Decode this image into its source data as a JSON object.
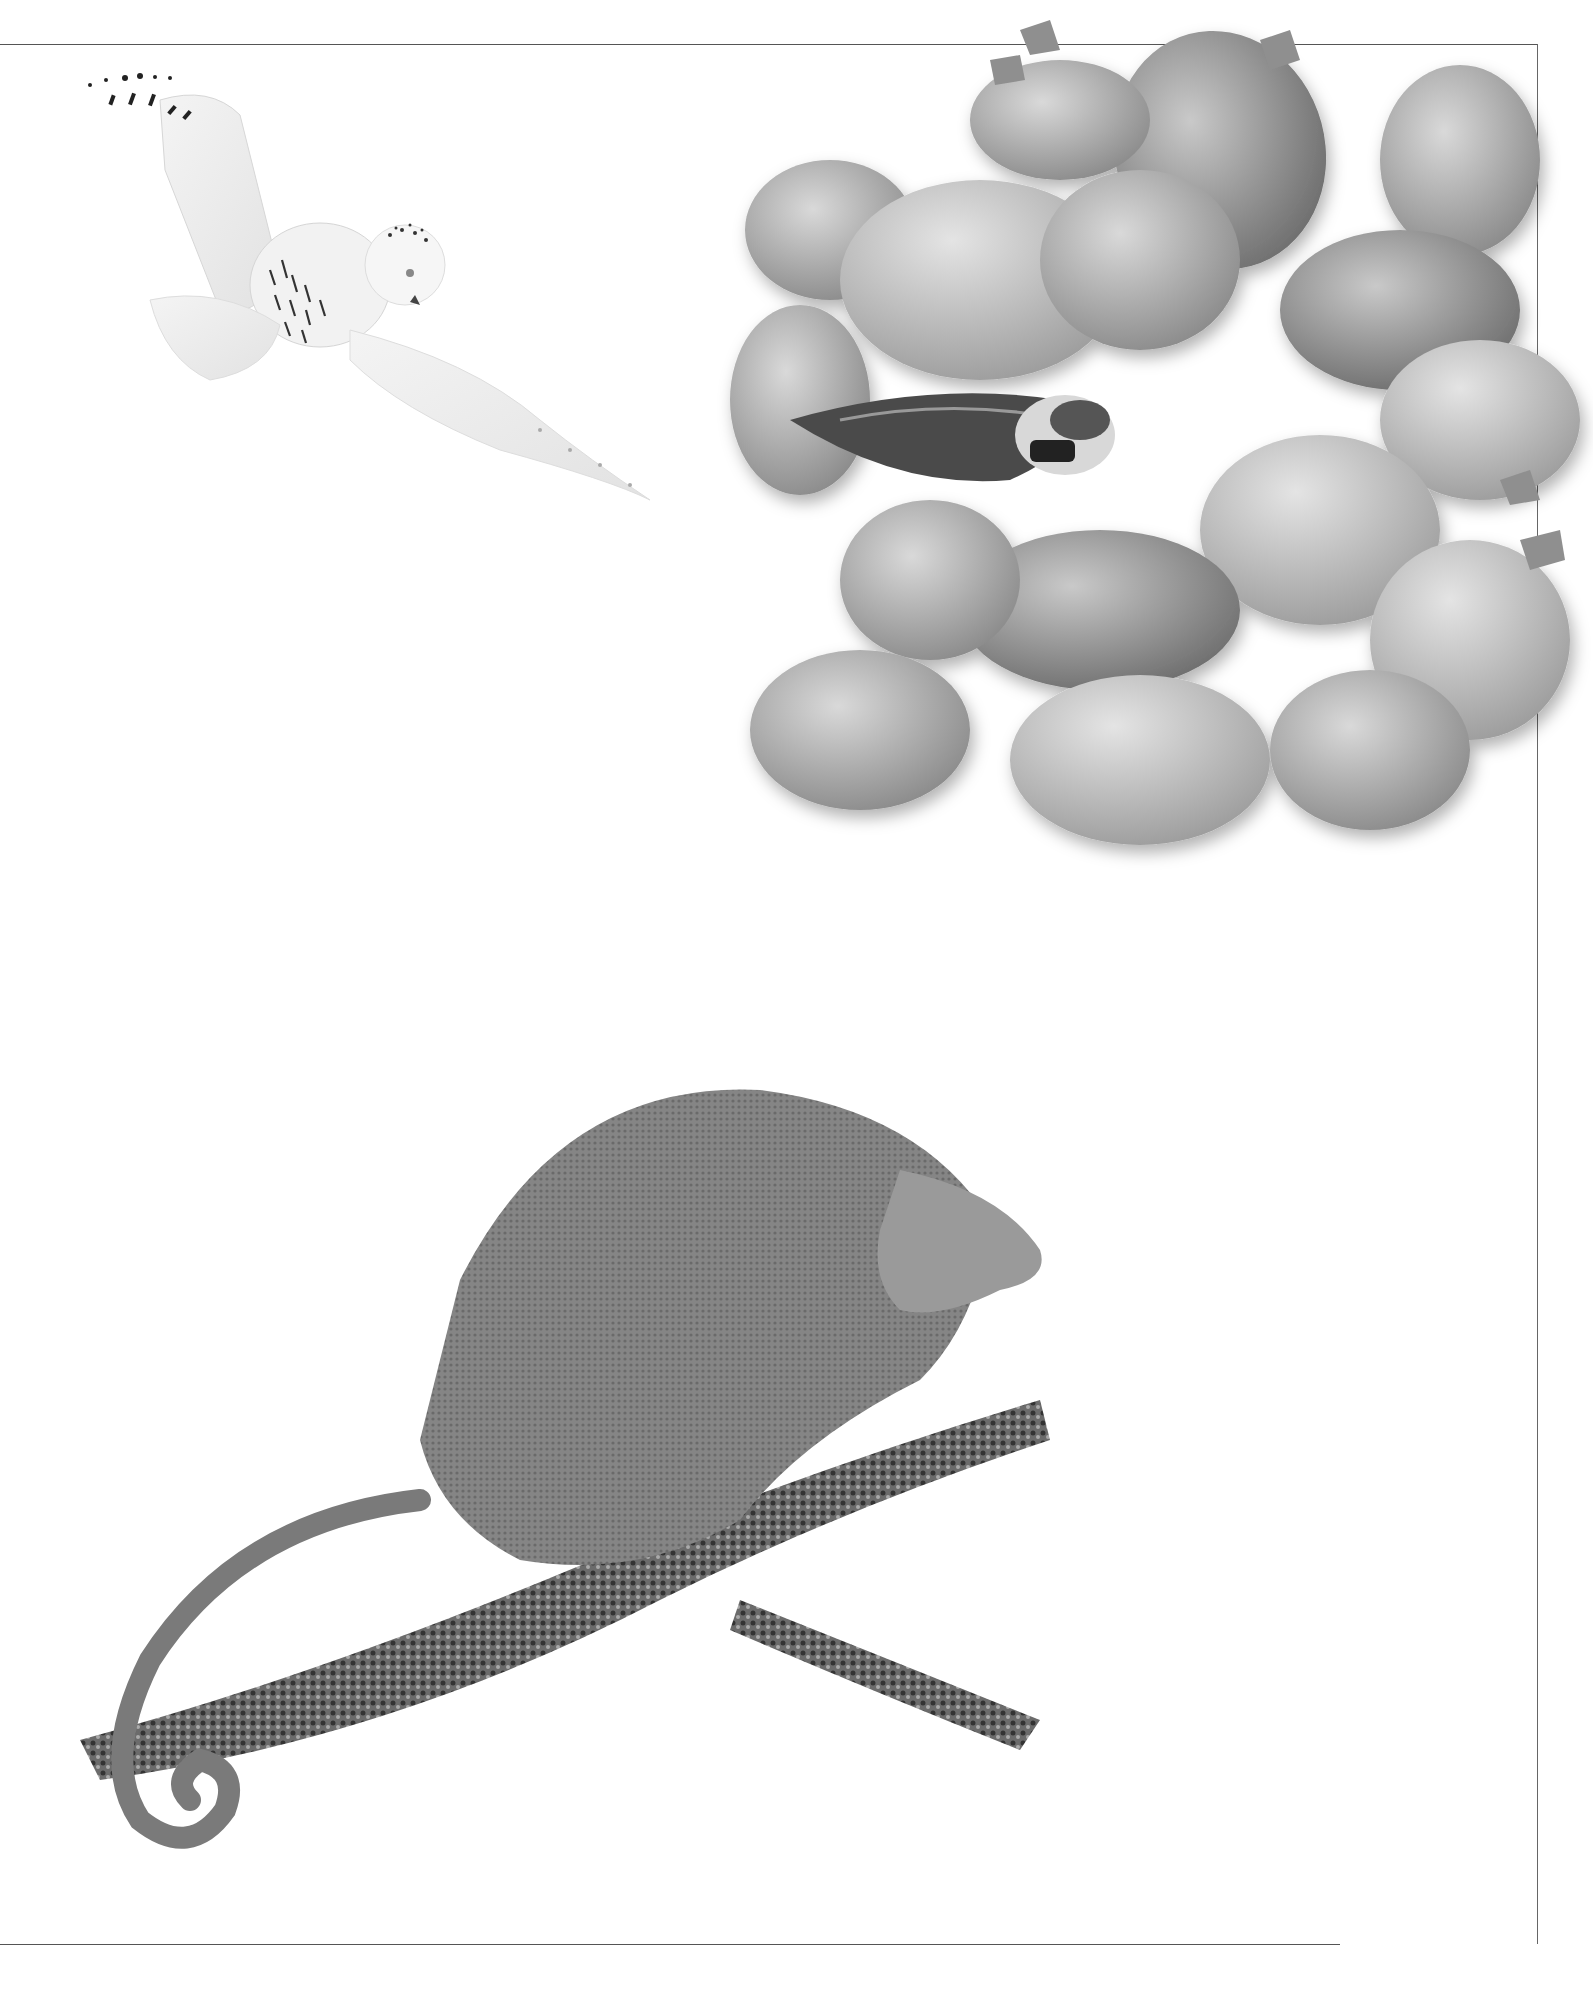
{
  "header": {
    "running_head": "CAMOUFLAGE"
  },
  "footer": {
    "page_number": "37"
  },
  "sections": {
    "arctic_owl": {
      "heading": "Arctic owl",
      "lines": [
        "The snowy owl has a coat of",
        "white feathers that allow it to",
        "blend in with the white landscape",
        "of the snow-covered Arctic",
        "tundra. Many owls living in other",
        "parts of the world hunt at night",
        "where they rely on the dark to",
        "hide them from danger. Summer",
        "days in the Arctic are very long,",
        "so the snowy owl has to fly in",
        "daylight to find food for its young.",
        "Without the camouflage of its",
        "feathers, the owl would be easily",
        "spotted by its prey."
      ]
    },
    "mimicking_stones": {
      "heading": "Mimicking stones",
      "lines": [
        "A pebble or gravel beach may seem an unlikely hiding place for",
        "a bird. Once it has landed, though, the ringed plover seems to",
        "simply disappear into this kind of background, thanks to its",
        "camouflage of black-and-white markings. The bird keeps",
        "its eggs just as well hidden on a pebble beach",
        "by hollowing out a nest burrow."
      ]
    },
    "body_language": {
      "heading": "Body language",
      "lines": [
        "The Parson’s chameleon from Africa lives",
        "in the jungle, where its khaki skin color",
        "blends in well with the background",
        "foliage. Although the chameleon is",
        "able to change its skin color, this",
        "skill is used only when it finds itself",
        "in danger. At the approach of an",
        "enemy, the chameleon’s warning",
        "system responds quickly by",
        "changing to a much darker skin",
        "color. At the same time, its tail",
        "uncurls and the body puffs itself",
        "up so that the chameleon",
        "looks its most frightening."
      ]
    },
    "concealed_shark": {
      "heading": "Concealed shark",
      "lines": [
        "The ornate wobbegong is a type of shark that",
        "lives in the tropical shallow seas off Australia",
        "and New Guinea. It lies with its body flattened",
        "out on the seafloor, where its color patterns of",
        "spots, blotches, and lines look like rocks and",
        "corals. A fringe of whiskers under its chin looks",
        "just like seaweed. With such a clever disguise, the",
        "wobbegong is able to pounce on unsuspecting",
        "prey that swim in front of its mouth."
      ]
    }
  },
  "captions": {
    "owl_feathers": [
      "White feathers hide the",
      "owl as it glides over",
      "snow-covered ground"
    ],
    "plover_wings": [
      "Patterned wings",
      "mimic stones"
    ],
    "skin_darkens": [
      "Skin color darkens",
      "when warning",
      "away enemies"
    ],
    "orange_eyes": [
      "Orange eyes darken",
      "to red when body",
      "changes color"
    ],
    "tail": [
      "Tail straightens out",
      "when chameleon",
      "senses danger"
    ],
    "watchful_eye": [
      "Watchful eye"
    ],
    "whiskers": [
      "Seaweedlike",
      "whiskers"
    ],
    "speckled": [
      "Speckled skin",
      "pattern mimics",
      "seafloor"
    ],
    "beard": [
      "“Beard” of",
      "skin tassels"
    ]
  },
  "labels": {
    "owl": [
      "FEMALE",
      "SNOWY OWL"
    ],
    "plover": [
      "RINGED PLOVER"
    ],
    "chameleon": [
      "PARSON’S",
      "CHAMELEON"
    ],
    "wobbegong": [
      "ORNATE",
      "WOBBEGONG"
    ]
  },
  "illustrations": [
    {
      "name": "snowy-owl-illustration"
    },
    {
      "name": "pebbles-and-ringed-plover-photo"
    },
    {
      "name": "parsons-chameleon-photo"
    },
    {
      "name": "ornate-wobbegong-photo"
    }
  ]
}
